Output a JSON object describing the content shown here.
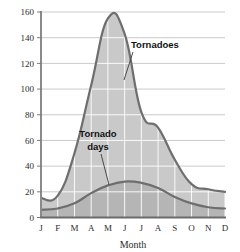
{
  "chart_data": {
    "type": "area",
    "title": "",
    "xlabel": "Month",
    "ylabel": "",
    "categories": [
      "J",
      "F",
      "M",
      "A",
      "M",
      "J",
      "J",
      "A",
      "S",
      "O",
      "N",
      "D"
    ],
    "category_names": [
      "January",
      "February",
      "March",
      "April",
      "May",
      "June",
      "July",
      "August",
      "September",
      "October",
      "November",
      "December"
    ],
    "series": [
      {
        "name": "Tornadoes",
        "values": [
          15,
          17,
          50,
          103,
          155,
          143,
          82,
          70,
          45,
          26,
          22,
          20
        ]
      },
      {
        "name": "Tornado days",
        "values": [
          6,
          7,
          11,
          19,
          25,
          28,
          27,
          23,
          16,
          11,
          8,
          7
        ]
      }
    ],
    "ylim": [
      0,
      160
    ],
    "yticks": [
      0,
      20,
      40,
      60,
      80,
      100,
      120,
      140,
      160
    ],
    "ytick_labels": [
      "0",
      "20",
      "40",
      "60",
      "80",
      "100",
      "120",
      "140",
      "160"
    ],
    "grid": true,
    "grid_color": "#ffffff",
    "legend_position": "inline-annotations",
    "annotations": [
      {
        "text": "Tornadoes",
        "lines": [
          "Tornadoes"
        ]
      },
      {
        "text": "Tornado days",
        "lines": [
          "Tornado",
          "days"
        ]
      }
    ],
    "colors": {
      "fill_upper": "#c9c9c9",
      "fill_lower": "#b7b7b7",
      "line": "#6b6b6b",
      "axis": "#7a7a7a",
      "text": "#2b2b2b"
    }
  },
  "axis": {
    "x_title": "Month"
  }
}
